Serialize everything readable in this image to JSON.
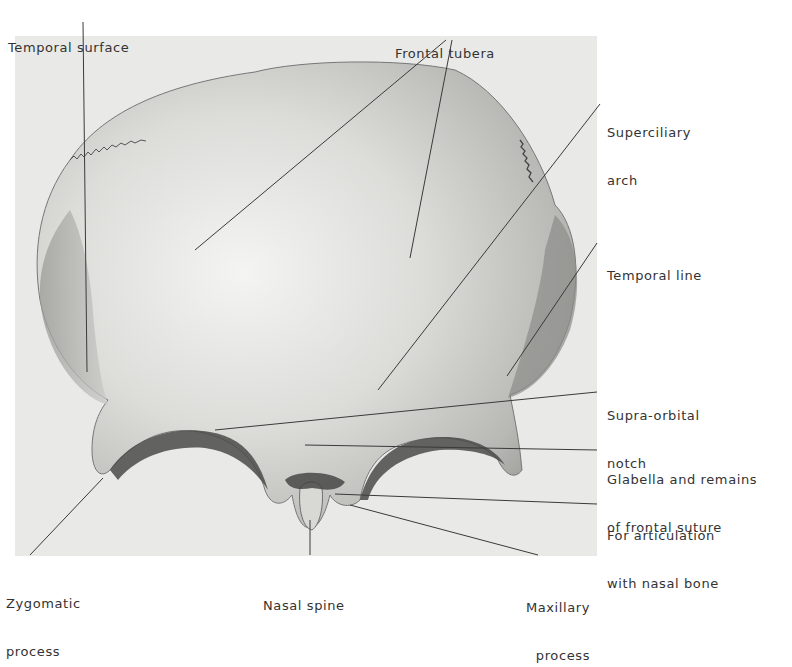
{
  "figure": {
    "labels": [
      {
        "id": "temporal-surface",
        "lines": [
          "Temporal surface"
        ]
      },
      {
        "id": "frontal-tubera",
        "lines": [
          "Frontal tubera"
        ]
      },
      {
        "id": "superciliary-arch",
        "lines": [
          "Superciliary",
          "arch"
        ]
      },
      {
        "id": "temporal-line",
        "lines": [
          "Temporal line"
        ]
      },
      {
        "id": "supra-orbital-notch",
        "lines": [
          "Supra-orbital",
          "notch"
        ]
      },
      {
        "id": "glabella",
        "lines": [
          "Glabella and remains",
          "of frontal suture"
        ]
      },
      {
        "id": "nasal-articulation",
        "lines": [
          "For articulation",
          "with nasal bone"
        ]
      },
      {
        "id": "zygomatic-process",
        "lines": [
          "Zygomatic",
          "process"
        ]
      },
      {
        "id": "nasal-spine",
        "lines": [
          "Nasal spine"
        ]
      },
      {
        "id": "maxillary-process",
        "lines": [
          "Maxillary",
          "process"
        ]
      }
    ]
  },
  "colors": {
    "background": "#ffffff",
    "photo_background": "#e9e9e7",
    "bone_light": "#f2f2f0",
    "bone_mid": "#cfcfcc",
    "bone_dark": "#6b6b68",
    "leader_line": "#3a3a3a",
    "text": "#333333"
  }
}
